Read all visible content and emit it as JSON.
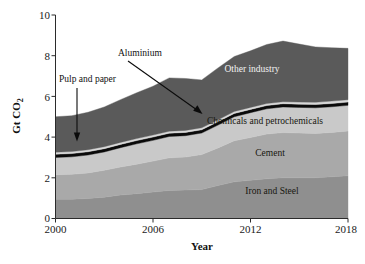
{
  "chart_data": {
    "type": "area",
    "stacked": true,
    "title": "",
    "xlabel": "Year",
    "ylabel": "Gt CO2",
    "ylabel_display": "Gt CO₂",
    "xlim": [
      2000,
      2018
    ],
    "ylim": [
      0,
      10
    ],
    "grid": false,
    "legend_position": "inline-band-labels",
    "x_ticks": [
      2000,
      2006,
      2012,
      2018
    ],
    "x_tick_labels": [
      "2000",
      "2006",
      "2012",
      "2018"
    ],
    "y_ticks": [
      0,
      2,
      4,
      6,
      8,
      10
    ],
    "y_tick_labels": [
      "0",
      "2",
      "4",
      "6",
      "8",
      "10"
    ],
    "x": [
      2000,
      2001,
      2002,
      2003,
      2004,
      2005,
      2006,
      2007,
      2008,
      2009,
      2010,
      2011,
      2012,
      2013,
      2014,
      2015,
      2016,
      2017,
      2018
    ],
    "series": [
      {
        "name": "Iron and Steel",
        "color": "#8f8f8f",
        "label_position": "inside",
        "label_color": "dark",
        "values": [
          0.95,
          0.95,
          0.98,
          1.05,
          1.15,
          1.22,
          1.3,
          1.38,
          1.4,
          1.42,
          1.62,
          1.8,
          1.88,
          1.95,
          2.0,
          2.0,
          2.0,
          2.05,
          2.1
        ]
      },
      {
        "name": "Cement",
        "color": "#a9a9a9",
        "label_position": "inside",
        "label_color": "dark",
        "values": [
          1.2,
          1.22,
          1.26,
          1.32,
          1.38,
          1.45,
          1.52,
          1.6,
          1.62,
          1.72,
          1.85,
          2.02,
          2.1,
          2.2,
          2.22,
          2.2,
          2.18,
          2.18,
          2.2
        ]
      },
      {
        "name": "Chemicals and petrochemicals",
        "color": "#c9c9c9",
        "label_position": "inside",
        "label_color": "dark",
        "values": [
          0.85,
          0.86,
          0.88,
          0.9,
          0.95,
          1.0,
          1.02,
          1.05,
          1.05,
          1.06,
          1.12,
          1.18,
          1.22,
          1.24,
          1.26,
          1.26,
          1.26,
          1.26,
          1.26
        ]
      },
      {
        "name": "Aluminium",
        "color": "#0a0a0a",
        "label_position": "annotation",
        "label_color": "dark",
        "values": [
          0.16,
          0.16,
          0.16,
          0.16,
          0.16,
          0.16,
          0.16,
          0.16,
          0.16,
          0.16,
          0.16,
          0.16,
          0.16,
          0.16,
          0.16,
          0.16,
          0.16,
          0.16,
          0.16
        ]
      },
      {
        "name": "Pulp and paper",
        "color": "#d8d8d8",
        "label_position": "annotation",
        "label_color": "dark",
        "values": [
          0.1,
          0.1,
          0.1,
          0.1,
          0.1,
          0.1,
          0.1,
          0.1,
          0.1,
          0.1,
          0.1,
          0.1,
          0.1,
          0.1,
          0.1,
          0.1,
          0.11,
          0.12,
          0.12
        ]
      },
      {
        "name": "Other industry",
        "color": "#5a5a5a",
        "label_position": "inside",
        "label_color": "light",
        "values": [
          1.74,
          1.76,
          1.84,
          1.95,
          2.1,
          2.25,
          2.4,
          2.62,
          2.55,
          2.35,
          2.55,
          2.7,
          2.78,
          2.9,
          2.98,
          2.85,
          2.72,
          2.62,
          2.52
        ]
      }
    ],
    "totals": [
      5.0,
      5.05,
      5.22,
      5.48,
      5.84,
      6.18,
      6.5,
      6.91,
      6.88,
      6.81,
      7.5,
      8.06,
      8.34,
      8.65,
      8.82,
      8.67,
      8.53,
      8.49,
      8.46
    ],
    "annotations": [
      {
        "text": "Pulp and paper",
        "target_series": "Pulp and paper",
        "arrow": "down",
        "label_x": 2000.4,
        "label_y": 6.9,
        "tip_x": 2001.6,
        "tip_y": 3.45
      },
      {
        "text": "Aluminium",
        "target_series": "Aluminium",
        "arrow": "diagonal",
        "label_x": 2004.6,
        "label_y": 8.25,
        "tip_x": 2009.1,
        "tip_y": 5.08
      }
    ]
  },
  "band_labels": {
    "other_industry": "Other industry",
    "chemicals": "Chemicals and petrochemicals",
    "cement": "Cement",
    "iron_and_steel": "Iron and Steel"
  },
  "annotations": {
    "pulp_and_paper": "Pulp and paper",
    "aluminium": "Aluminium"
  },
  "axes": {
    "x_title": "Year",
    "y_title": "Gt CO",
    "y_title_sub": "2",
    "x_tick_0": "2000",
    "x_tick_1": "2006",
    "x_tick_2": "2012",
    "x_tick_3": "2018",
    "y_tick_0": "0",
    "y_tick_1": "2",
    "y_tick_2": "4",
    "y_tick_3": "6",
    "y_tick_4": "8",
    "y_tick_5": "10"
  }
}
